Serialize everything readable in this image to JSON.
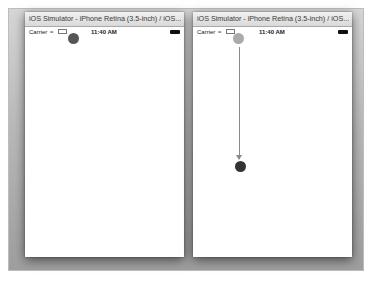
{
  "windows": [
    {
      "title": "iOS Simulator - iPhone Retina (3.5-inch) / iOS...",
      "status": {
        "carrier": "Carrier",
        "wifi_icon": "wifi-icon",
        "network": "LTE",
        "time": "11:40 AM",
        "battery_icon": "battery-icon"
      },
      "dot": {
        "color": "#555555"
      }
    },
    {
      "title": "iOS Simulator - iPhone Retina (3.5-inch) / iOS...",
      "status": {
        "carrier": "Carrier",
        "wifi_icon": "wifi-icon",
        "network": "LTE",
        "time": "11:40 AM",
        "battery_icon": "battery-icon"
      },
      "start_dot": {
        "color": "#aaaaaa"
      },
      "end_dot": {
        "color": "#333333"
      },
      "arrow": {
        "color": "#8a8a8a",
        "direction": "down"
      }
    }
  ]
}
